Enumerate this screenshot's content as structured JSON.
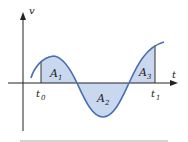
{
  "diagram": {
    "axes": {
      "vertical_label": "v",
      "horizontal_label": "t"
    },
    "time_marks": {
      "start": "t",
      "start_sub": "0",
      "end": "t",
      "end_sub": "1"
    },
    "regions": [
      {
        "label": "A",
        "sub": "1",
        "sign": "positive"
      },
      {
        "label": "A",
        "sub": "2",
        "sign": "negative"
      },
      {
        "label": "A",
        "sub": "3",
        "sign": "positive"
      }
    ],
    "colors": {
      "curve": "#4a6fb0",
      "fill": "#c9d8ef",
      "axis": "#222222",
      "baseline": "#aaaaaa"
    }
  }
}
